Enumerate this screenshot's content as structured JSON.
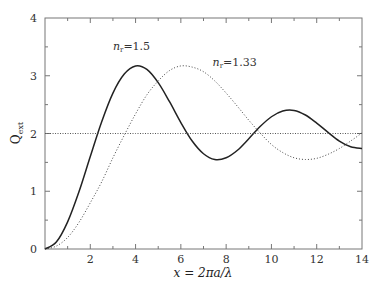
{
  "chart_data": {
    "type": "line",
    "title": "",
    "xlabel": "x = 2πa/λ",
    "ylabel": "Q_ext",
    "xlim": [
      0,
      14
    ],
    "ylim": [
      0,
      4
    ],
    "grid": false,
    "legend": "none (inline annotations)",
    "x_ticks": [
      2,
      4,
      6,
      8,
      10,
      12,
      14
    ],
    "x_tick_labels": [
      "2",
      "4",
      "6",
      "8",
      "10",
      "12",
      "14"
    ],
    "y_ticks": [
      0,
      1,
      2,
      3,
      4
    ],
    "y_tick_labels": [
      "0",
      "1",
      "2",
      "3",
      "4"
    ],
    "x": [
      0,
      0.5,
      1,
      1.5,
      2,
      2.5,
      3,
      3.5,
      4,
      4.5,
      5,
      5.5,
      6,
      6.5,
      7,
      7.5,
      8,
      8.5,
      9,
      9.5,
      10,
      10.5,
      11,
      11.5,
      12,
      12.5,
      13,
      13.5,
      14
    ],
    "series": [
      {
        "name": "n_r=1.5",
        "style": "solid",
        "values": [
          0,
          0.12,
          0.47,
          0.99,
          1.6,
          2.2,
          2.7,
          3.03,
          3.17,
          3.11,
          2.88,
          2.55,
          2.19,
          1.87,
          1.65,
          1.55,
          1.58,
          1.71,
          1.91,
          2.12,
          2.29,
          2.39,
          2.4,
          2.32,
          2.18,
          2.02,
          1.87,
          1.77,
          1.74
        ]
      },
      {
        "name": "n_r=1.33",
        "style": "dotted",
        "values": [
          0,
          0.05,
          0.2,
          0.46,
          0.8,
          1.16,
          1.58,
          1.97,
          2.34,
          2.67,
          2.91,
          3.09,
          3.17,
          3.15,
          3.07,
          2.91,
          2.7,
          2.47,
          2.23,
          2.01,
          1.81,
          1.67,
          1.58,
          1.55,
          1.57,
          1.64,
          1.74,
          1.87,
          2.01
        ]
      },
      {
        "name": "asymptote Q=2",
        "style": "dotted-horizontal",
        "values": [
          2,
          2,
          2,
          2,
          2,
          2,
          2,
          2,
          2,
          2,
          2,
          2,
          2,
          2,
          2,
          2,
          2,
          2,
          2,
          2,
          2,
          2,
          2,
          2,
          2,
          2,
          2,
          2,
          2
        ]
      }
    ],
    "annotations": [
      {
        "text_main": "n",
        "text_sub": "r",
        "text_rest": "=1.5",
        "x": 3.0,
        "y": 3.45
      },
      {
        "text_main": "n",
        "text_sub": "r",
        "text_rest": "=1.33",
        "x": 7.4,
        "y": 3.17
      }
    ]
  },
  "labels": {
    "y_main": "Q",
    "y_sub": "ext",
    "x_axis": "x = 2πa/λ"
  }
}
